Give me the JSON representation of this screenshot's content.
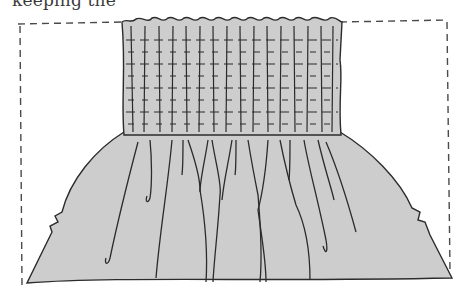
{
  "page": {
    "caption_fragment": "keeping the",
    "figure": {
      "subject": "smocked fabric panel gathering into full skirt",
      "colors": {
        "fabric_fill": "#cdcdcd",
        "ink": "#2b2b2b",
        "frame_dash": "#4a4a4a",
        "background": "#ffffff"
      },
      "smocking_grid": {
        "columns": 16,
        "rows": 9
      }
    }
  }
}
